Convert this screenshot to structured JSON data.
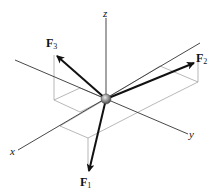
{
  "diagram": {
    "type": "3d-force-vectors",
    "axes": {
      "x": {
        "label": "x"
      },
      "y": {
        "label": "y"
      },
      "z": {
        "label": "z"
      }
    },
    "forces": [
      {
        "id": "F1",
        "symbol": "F",
        "subscript": "1"
      },
      {
        "id": "F2",
        "symbol": "F",
        "subscript": "2"
      },
      {
        "id": "F3",
        "symbol": "F",
        "subscript": "3"
      }
    ],
    "colors": {
      "axis": "#333333",
      "box": "#9a9a9a",
      "arrow": "#111111",
      "particle": "#8a8a8a"
    }
  }
}
